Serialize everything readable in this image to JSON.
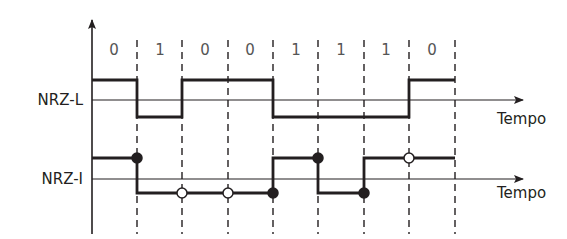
{
  "diagram": {
    "bits": [
      "0",
      "1",
      "0",
      "0",
      "1",
      "1",
      "1",
      "0"
    ],
    "signals": [
      {
        "name": "NRZ-L",
        "axis_label": "Tempo",
        "levels": [
          "high",
          "low",
          "high",
          "high",
          "low",
          "low",
          "low",
          "high"
        ]
      },
      {
        "name": "NRZ-I",
        "axis_label": "Tempo",
        "levels": [
          "high",
          "low",
          "low",
          "low",
          "high",
          "low",
          "high",
          "high"
        ],
        "markers": [
          {
            "boundary": 1,
            "type": "filled"
          },
          {
            "boundary": 2,
            "type": "open"
          },
          {
            "boundary": 3,
            "type": "open"
          },
          {
            "boundary": 4,
            "type": "filled"
          },
          {
            "boundary": 5,
            "type": "filled"
          },
          {
            "boundary": 6,
            "type": "filled"
          },
          {
            "boundary": 7,
            "type": "open"
          }
        ]
      }
    ],
    "colors": {
      "line": "#231f20",
      "dash": "#231f20",
      "bit_text": "#555555"
    }
  }
}
